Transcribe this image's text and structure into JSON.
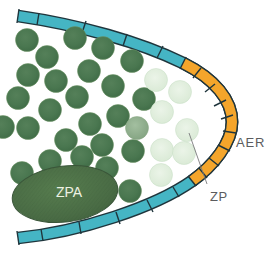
{
  "figure": {
    "background": "#ffffff",
    "cell_radius": 11.5,
    "colors": {
      "ectoderm_teal": "#45b5c4",
      "aer_orange": "#f4a52b",
      "outline_dark": "#1f353c",
      "cell_dark_edge": "#6d9663",
      "cell_medium_edge": "#85a57f",
      "cell_light_edge": "#c6ddc3",
      "leader_line": "#7a7b7d",
      "label_gray": "#5b5c5e",
      "zpa_text_color": "#edf2e3"
    },
    "band": {
      "teal_path": "M 18 16 C 80 25 140 42 183 63 C 215 79 232 100 232 122 C 232 143 213 166 192 181 C 155 207 80 232 18 238",
      "orange_path": "M 183 63 C 215 79 232 100 232 122 C 232 143 213 166 192 181",
      "width": 10,
      "outline_width": 12.8,
      "divider_width": 1.4,
      "dividers": [
        [
          19,
          9,
          17,
          23
        ],
        [
          39,
          13,
          37,
          25
        ],
        [
          86,
          21,
          82,
          33
        ],
        [
          127,
          34,
          123,
          46
        ],
        [
          163,
          46,
          157,
          58
        ],
        [
          186,
          57,
          180,
          69
        ],
        [
          201,
          68,
          193,
          78
        ],
        [
          215,
          84,
          205,
          92
        ],
        [
          226,
          100,
          214,
          106
        ],
        [
          233,
          115,
          221,
          119
        ],
        [
          236,
          133,
          223,
          131
        ],
        [
          230,
          151,
          218,
          145
        ],
        [
          219,
          166,
          209,
          158
        ],
        [
          207,
          178,
          199,
          168
        ],
        [
          196,
          186,
          188,
          176
        ],
        [
          179,
          197,
          173,
          187
        ],
        [
          153,
          212,
          147,
          200
        ],
        [
          120,
          224,
          116,
          212
        ],
        [
          81,
          234,
          79,
          222
        ],
        [
          43,
          241,
          41,
          229
        ],
        [
          17,
          231,
          19,
          245
        ]
      ]
    },
    "cells": [
      {
        "x": 27,
        "y": 40,
        "shade": "dark"
      },
      {
        "x": 75,
        "y": 38,
        "shade": "dark"
      },
      {
        "x": 103,
        "y": 48,
        "shade": "dark"
      },
      {
        "x": 47,
        "y": 57,
        "shade": "dark"
      },
      {
        "x": 132,
        "y": 61,
        "shade": "dark"
      },
      {
        "x": 28,
        "y": 75,
        "shade": "dark"
      },
      {
        "x": 89,
        "y": 71,
        "shade": "dark"
      },
      {
        "x": 56,
        "y": 81,
        "shade": "dark"
      },
      {
        "x": 113,
        "y": 86,
        "shade": "dark"
      },
      {
        "x": 18,
        "y": 98,
        "shade": "dark"
      },
      {
        "x": 77,
        "y": 97,
        "shade": "dark"
      },
      {
        "x": 144,
        "y": 99,
        "shade": "dark"
      },
      {
        "x": 50,
        "y": 110,
        "shade": "dark"
      },
      {
        "x": 118,
        "y": 116,
        "shade": "dark"
      },
      {
        "x": 90,
        "y": 124,
        "shade": "dark"
      },
      {
        "x": 28,
        "y": 128,
        "shade": "dark"
      },
      {
        "x": 3,
        "y": 127,
        "shade": "dark"
      },
      {
        "x": 66,
        "y": 140,
        "shade": "dark"
      },
      {
        "x": 102,
        "y": 145,
        "shade": "dark"
      },
      {
        "x": 133,
        "y": 151,
        "shade": "dark"
      },
      {
        "x": 50,
        "y": 161,
        "shade": "dark"
      },
      {
        "x": 82,
        "y": 157,
        "shade": "dark"
      },
      {
        "x": 22,
        "y": 173,
        "shade": "dark"
      },
      {
        "x": 107,
        "y": 168,
        "shade": "dark"
      },
      {
        "x": 130,
        "y": 191,
        "shade": "dark"
      },
      {
        "x": 137,
        "y": 128,
        "shade": "medium"
      },
      {
        "x": 156,
        "y": 80,
        "shade": "light"
      },
      {
        "x": 180,
        "y": 92,
        "shade": "light"
      },
      {
        "x": 162,
        "y": 112,
        "shade": "light"
      },
      {
        "x": 187,
        "y": 130,
        "shade": "light"
      },
      {
        "x": 162,
        "y": 150,
        "shade": "light"
      },
      {
        "x": 184,
        "y": 153,
        "shade": "light"
      },
      {
        "x": 161,
        "y": 175,
        "shade": "light"
      }
    ],
    "zpa": {
      "cx": 65,
      "cy": 194,
      "rx": 53,
      "ry": 28,
      "rotate": -7,
      "label": "ZPA",
      "label_x": 69,
      "label_y": 197,
      "font_size": 14
    },
    "labels": {
      "aer": {
        "text": "AER",
        "x": 236,
        "y": 147,
        "font_size": 13,
        "letter_spacing": 0.8
      },
      "zp": {
        "text": "ZP",
        "x": 210,
        "y": 201,
        "font_size": 13,
        "letter_spacing": 0.5
      }
    },
    "leader": {
      "x1": 207,
      "y1": 184,
      "x2": 189,
      "y2": 133,
      "width": 0.9
    }
  }
}
